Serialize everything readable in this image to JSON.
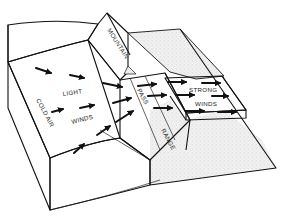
{
  "diagram": {
    "labels": {
      "cold_air": "COLD AIR",
      "light": "LIGHT",
      "winds_light": "WINDS",
      "mountain": "MOUNTAIN",
      "pass": "PASS",
      "range": "RANGE",
      "strong": "STRONG",
      "winds_strong": "WINDS"
    },
    "regions": [
      {
        "name": "cold-air-basin",
        "fill": "#ffffff"
      },
      {
        "name": "mountain-range",
        "fill": "#ffffff"
      },
      {
        "name": "lee-slope",
        "fill": "#e9e9e9",
        "texture": "stipple"
      },
      {
        "name": "strong-wind-channel",
        "fill": "#ffffff"
      }
    ],
    "arrows": {
      "light_winds_count": 9,
      "strong_winds_count": 6
    },
    "colors": {
      "line": "#111111",
      "stipple": "#bdbdbd",
      "background": "#ffffff"
    }
  }
}
